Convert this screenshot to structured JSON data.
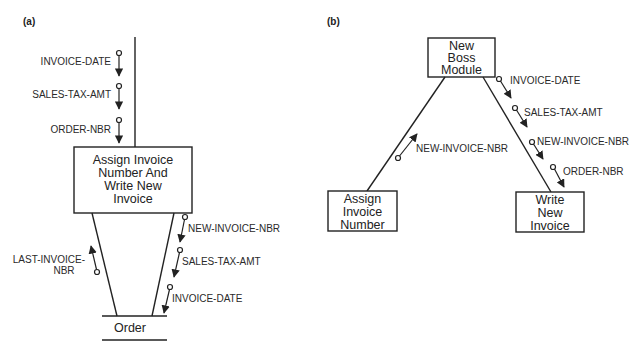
{
  "panel_a": {
    "label": "(a)",
    "module": {
      "lines": [
        "Assign Invoice",
        "Number And",
        "Write New",
        "Invoice"
      ]
    },
    "data_store": {
      "label": "Order"
    },
    "inputs_from_above": [
      "INVOICE-DATE",
      "SALES-TAX-AMT",
      "ORDER-NBR"
    ],
    "read_from_store": {
      "lines": [
        "LAST-INVOICE-",
        "NBR"
      ]
    },
    "write_to_store": [
      "NEW-INVOICE-NBR",
      "SALES-TAX-AMT",
      "INVOICE-DATE"
    ]
  },
  "panel_b": {
    "label": "(b)",
    "boss": {
      "lines": [
        "New",
        "Boss",
        "Module"
      ]
    },
    "assign": {
      "lines": [
        "Assign",
        "Invoice",
        "Number"
      ]
    },
    "write": {
      "lines": [
        "Write",
        "New",
        "Invoice"
      ]
    },
    "from_assign": [
      "NEW-INVOICE-NBR"
    ],
    "to_write": [
      "INVOICE-DATE",
      "SALES-TAX-AMT",
      "NEW-INVOICE-NBR",
      "ORDER-NBR"
    ]
  }
}
